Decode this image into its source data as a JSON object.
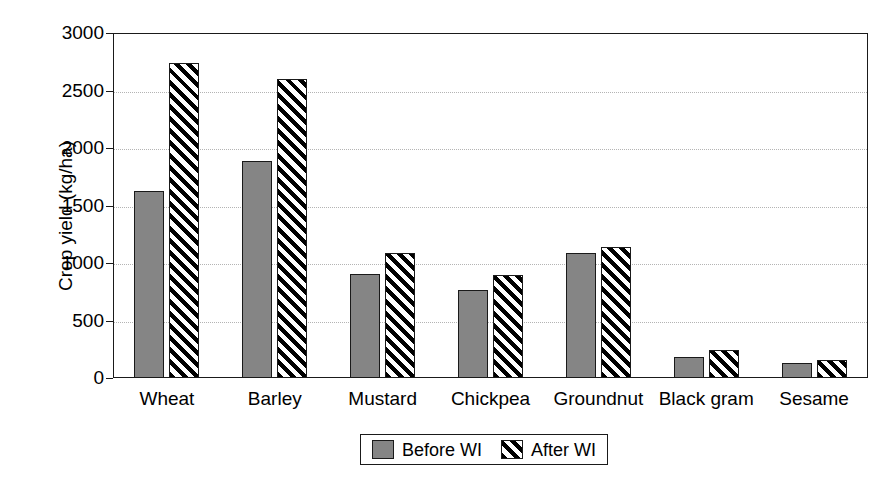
{
  "chart_data": {
    "type": "bar",
    "title": "",
    "xlabel": "",
    "ylabel": "Crop yield (kg/ha)",
    "ylim": [
      0,
      3000
    ],
    "ytick_step": 500,
    "yticks": [
      "3000",
      "2500",
      "2000",
      "1500",
      "1000",
      "500",
      "0"
    ],
    "ytick_values": [
      3000,
      2500,
      2000,
      1500,
      1000,
      500,
      0
    ],
    "grid": true,
    "grid_axis": "y",
    "grid_style": "dotted",
    "legend_position": "bottom-center",
    "categories": [
      "Wheat",
      "Barley",
      "Mustard",
      "Chickpea",
      "Groundnut",
      "Black gram",
      "Sesame"
    ],
    "series": [
      {
        "name": "Before WI",
        "fill": "solid-gray",
        "color": "#858585",
        "values": [
          1630,
          1890,
          905,
          765,
          1085,
          185,
          130
        ]
      },
      {
        "name": "After WI",
        "fill": "diagonal-hatch",
        "color": "#000000",
        "values": [
          2740,
          2600,
          1090,
          895,
          1135,
          240,
          155
        ]
      }
    ]
  },
  "legend": {
    "entries": [
      {
        "label": "Before WI"
      },
      {
        "label": "After WI"
      }
    ]
  },
  "colors": {
    "before_wi": "#858585",
    "after_wi": "#000000",
    "axis": "#1a1a1a",
    "gridline": "#b4b4b4",
    "background": "#ffffff"
  }
}
